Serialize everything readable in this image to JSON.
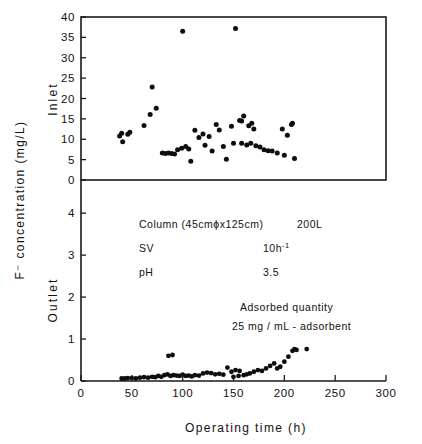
{
  "chart_data": {
    "type": "scatter",
    "title": "",
    "xlabel": "Operating  time (h)",
    "ylabel": "F⁻ concentration (mg/L)",
    "xlim": [
      0,
      300
    ],
    "xticks": [
      0,
      50,
      100,
      150,
      200,
      250,
      300
    ],
    "xticklabels": [
      "0",
      "50",
      "100",
      "150",
      "200",
      "250",
      "300"
    ],
    "grid": false,
    "legend": "none",
    "panels": [
      {
        "name": "Inlet",
        "label": "Inlet",
        "ylim": [
          0,
          40
        ],
        "yticks": [
          0,
          5,
          10,
          15,
          20,
          25,
          30,
          35,
          40
        ],
        "yticklabels": [
          "0",
          "5",
          "10",
          "15",
          "20",
          "25",
          "30",
          "35",
          "40"
        ],
        "series": [
          {
            "name": "Inlet F- concentration",
            "marker": "filled-circle",
            "color": "#0d0d0d",
            "points": [
              [
                38,
                10.8
              ],
              [
                40,
                11.5
              ],
              [
                41,
                9.4
              ],
              [
                46,
                11.2
              ],
              [
                48,
                11.7
              ],
              [
                62,
                13.4
              ],
              [
                68,
                16.1
              ],
              [
                70,
                22.8
              ],
              [
                74,
                17.6
              ],
              [
                80,
                6.6
              ],
              [
                83,
                6.5
              ],
              [
                86,
                6.6
              ],
              [
                89,
                6.5
              ],
              [
                92,
                6.4
              ],
              [
                95,
                7.4
              ],
              [
                99,
                7.8
              ],
              [
                103,
                8.2
              ],
              [
                106,
                7.6
              ],
              [
                100,
                36.5
              ],
              [
                108,
                4.6
              ],
              [
                112,
                12.2
              ],
              [
                116,
                10.4
              ],
              [
                120,
                11.3
              ],
              [
                122,
                8.5
              ],
              [
                126,
                10.7
              ],
              [
                129,
                7.1
              ],
              [
                133,
                13.6
              ],
              [
                136,
                12.3
              ],
              [
                140,
                8.2
              ],
              [
                143,
                5.1
              ],
              [
                148,
                13.2
              ],
              [
                150,
                9.0
              ],
              [
                152,
                37.2
              ],
              [
                156,
                14.6
              ],
              [
                158,
                14.5
              ],
              [
                160,
                15.7
              ],
              [
                165,
                13.3
              ],
              [
                168,
                13.9
              ],
              [
                170,
                12.5
              ],
              [
                158,
                9.0
              ],
              [
                163,
                8.6
              ],
              [
                167,
                9.0
              ],
              [
                172,
                8.4
              ],
              [
                176,
                8.1
              ],
              [
                180,
                7.4
              ],
              [
                184,
                7.2
              ],
              [
                188,
                7.1
              ],
              [
                193,
                6.6
              ],
              [
                198,
                12.5
              ],
              [
                203,
                11.0
              ],
              [
                207,
                13.6
              ],
              [
                208,
                13.9
              ],
              [
                200,
                6.1
              ],
              [
                210,
                5.3
              ]
            ]
          }
        ]
      },
      {
        "name": "Outlet",
        "label": "Outlet",
        "ylim": [
          0,
          4.6
        ],
        "yticks": [
          0,
          1,
          2,
          3,
          4
        ],
        "yticklabels": [
          "0",
          "1",
          "2",
          "3",
          "4"
        ],
        "annotations": [
          {
            "id": "column",
            "left": "Column (45cmϕx125cm)",
            "right": "200L"
          },
          {
            "id": "sv",
            "left": "SV",
            "right": "10h",
            "sup": "-1"
          },
          {
            "id": "ph",
            "left": "pH",
            "right": "3.5"
          },
          {
            "id": "adsorbed-title",
            "text": "Adsorbed quantity"
          },
          {
            "id": "adsorbed-value",
            "text": "25 mg / mL - adsorbent"
          }
        ],
        "series": [
          {
            "name": "Outlet F- concentration",
            "marker": "filled-circle",
            "color": "#0d0d0d",
            "points": [
              [
                40,
                0.06
              ],
              [
                43,
                0.06
              ],
              [
                46,
                0.07
              ],
              [
                50,
                0.07
              ],
              [
                54,
                0.06
              ],
              [
                58,
                0.08
              ],
              [
                62,
                0.09
              ],
              [
                66,
                0.08
              ],
              [
                70,
                0.1
              ],
              [
                73,
                0.09
              ],
              [
                76,
                0.12
              ],
              [
                79,
                0.1
              ],
              [
                82,
                0.14
              ],
              [
                85,
                0.16
              ],
              [
                86,
                0.6
              ],
              [
                90,
                0.62
              ],
              [
                88,
                0.12
              ],
              [
                91,
                0.14
              ],
              [
                94,
                0.13
              ],
              [
                97,
                0.12
              ],
              [
                100,
                0.15
              ],
              [
                103,
                0.12
              ],
              [
                106,
                0.13
              ],
              [
                109,
                0.11
              ],
              [
                112,
                0.14
              ],
              [
                116,
                0.13
              ],
              [
                120,
                0.18
              ],
              [
                124,
                0.2
              ],
              [
                128,
                0.19
              ],
              [
                132,
                0.16
              ],
              [
                136,
                0.17
              ],
              [
                140,
                0.15
              ],
              [
                144,
                0.32
              ],
              [
                148,
                0.22
              ],
              [
                152,
                0.26
              ],
              [
                156,
                0.24
              ],
              [
                150,
                0.1
              ],
              [
                155,
                0.12
              ],
              [
                160,
                0.14
              ],
              [
                163,
                0.16
              ],
              [
                166,
                0.18
              ],
              [
                170,
                0.22
              ],
              [
                174,
                0.26
              ],
              [
                178,
                0.24
              ],
              [
                182,
                0.3
              ],
              [
                186,
                0.36
              ],
              [
                190,
                0.42
              ],
              [
                193,
                0.3
              ],
              [
                196,
                0.34
              ],
              [
                200,
                0.46
              ],
              [
                204,
                0.58
              ],
              [
                208,
                0.72
              ],
              [
                210,
                0.76
              ],
              [
                212,
                0.74
              ],
              [
                222,
                0.76
              ]
            ]
          }
        ]
      }
    ]
  }
}
